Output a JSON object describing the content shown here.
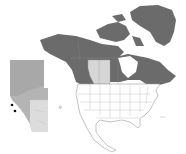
{
  "map": {
    "type": "locator-map",
    "main_region": "North America",
    "inset_region": "Alberta",
    "highlighted_province": "Alberta",
    "colors": {
      "canada_fill": "#6b6b6b",
      "greenland_fill": "#6b6b6b",
      "prairie_highlight": "#d6d6d6",
      "us_mexico_fill": "#ffffff",
      "border_stroke": "#9a9a9a",
      "inset_relief_dark": "#9c9c9c",
      "inset_relief_light": "#d9d9d9",
      "marker": "#111111"
    },
    "inset_markers": [
      {
        "x": 12,
        "y": 105
      },
      {
        "x": 15,
        "y": 111
      }
    ]
  }
}
